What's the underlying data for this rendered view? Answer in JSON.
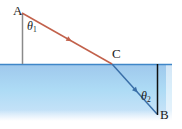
{
  "figure": {
    "width": 182,
    "height": 129,
    "background": "#ffffff"
  },
  "colors": {
    "water_fill_top": "#a8cdee",
    "water_fill_bottom": "#cfe3f7",
    "surface_line": "#3f86c8",
    "incident_ray": "#c2614b",
    "refracted_ray": "#3a6fa8",
    "normal_upper": "#8a8a8a",
    "normal_lower": "#101010",
    "label_text": "#1a1a1a"
  },
  "labels": {
    "point_a": "A",
    "point_b": "B",
    "point_c": "C",
    "theta1_symbol": "θ",
    "theta1_sub": "1",
    "theta2_symbol": "θ",
    "theta2_sub": "2"
  },
  "geometry": {
    "point_a": {
      "x": 22,
      "y": 13
    },
    "point_c": {
      "x": 112,
      "y": 64
    },
    "point_b": {
      "x": 157,
      "y": 114
    },
    "surface_y": 64,
    "water_left": 0,
    "water_right": 172,
    "water_bottom": 120,
    "normal_upper": {
      "x": 22,
      "y1": 13,
      "y2": 64
    },
    "normal_lower": {
      "x": 157,
      "y1": 64,
      "y2": 115
    },
    "incident_arrow_at": {
      "x": 67,
      "y": 38
    },
    "refracted_arrow_at": {
      "x": 134,
      "y": 89
    }
  }
}
